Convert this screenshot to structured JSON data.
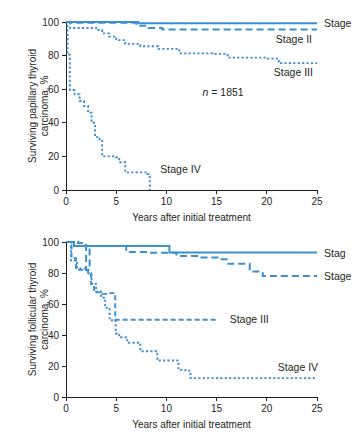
{
  "figure": {
    "title": "",
    "accent_color": "#3b8fd4",
    "text_color": "#231f20"
  },
  "chart_data": [
    {
      "id": "papillary",
      "type": "line",
      "title": "",
      "xlabel": "Years after initial treatment",
      "ylabel": "Surviving papillary thyroid carcinoma, %",
      "xlim": [
        0,
        25
      ],
      "ylim": [
        0,
        100
      ],
      "xticks": [
        0,
        5,
        10,
        15,
        20,
        25
      ],
      "yticks": [
        0,
        20,
        40,
        60,
        80,
        100
      ],
      "grid": false,
      "legend_position": "inline-right",
      "annotation": {
        "symbol": "n",
        "equals": "=",
        "value": "1851",
        "x": 13.6,
        "y": 56
      },
      "series": [
        {
          "name": "Stage I",
          "label": "Stage",
          "label_clipped": true,
          "style": "solid",
          "color": "#3b8fd4",
          "label_x": 25.4,
          "label_y": 99,
          "points": [
            [
              0,
              100
            ],
            [
              7.2,
              100
            ],
            [
              7.2,
              99.3
            ],
            [
              25,
              99.3
            ]
          ]
        },
        {
          "name": "Stage II",
          "label": "Stage II",
          "label_clipped": false,
          "style": "dashed",
          "color": "#3b8fd4",
          "label_x": 20.6,
          "label_y": 90,
          "points": [
            [
              0,
              100
            ],
            [
              0.6,
              100
            ],
            [
              0.6,
              99.6
            ],
            [
              7.0,
              99.6
            ],
            [
              7.0,
              97.8
            ],
            [
              8.2,
              97.8
            ],
            [
              8.2,
              96.5
            ],
            [
              9.6,
              96.5
            ],
            [
              9.6,
              95.6
            ],
            [
              25,
              95.6
            ]
          ]
        },
        {
          "name": "Stage III",
          "label": "Stage III",
          "label_clipped": false,
          "style": "dotted",
          "color": "#3b8fd4",
          "label_x": 20.4,
          "label_y": 70,
          "points": [
            [
              0,
              100
            ],
            [
              0.4,
              100
            ],
            [
              0.4,
              96.4
            ],
            [
              3.0,
              96.4
            ],
            [
              3.0,
              95.2
            ],
            [
              3.6,
              95.2
            ],
            [
              3.6,
              93.2
            ],
            [
              4.3,
              93.2
            ],
            [
              4.3,
              91.3
            ],
            [
              5.0,
              91.3
            ],
            [
              5.0,
              89.2
            ],
            [
              5.9,
              89.2
            ],
            [
              5.9,
              87.0
            ],
            [
              7.4,
              87.0
            ],
            [
              7.4,
              85.6
            ],
            [
              9.2,
              85.6
            ],
            [
              9.2,
              84.0
            ],
            [
              11.3,
              84.0
            ],
            [
              11.3,
              81.3
            ],
            [
              14.6,
              81.3
            ],
            [
              14.6,
              81.0
            ],
            [
              16.1,
              81.0
            ],
            [
              16.1,
              78.8
            ],
            [
              20.0,
              78.8
            ],
            [
              20.0,
              78.2
            ],
            [
              21.2,
              78.2
            ],
            [
              21.2,
              75.5
            ],
            [
              25,
              75.5
            ]
          ]
        },
        {
          "name": "Stage IV",
          "label": "Stage IV",
          "label_clipped": false,
          "style": "dotted",
          "color": "#3b8fd4",
          "label_x": 9.1,
          "label_y": 12.5,
          "points": [
            [
              0,
              100
            ],
            [
              0.15,
              100
            ],
            [
              0.15,
              80.5
            ],
            [
              0.38,
              80.5
            ],
            [
              0.38,
              59.5
            ],
            [
              0.85,
              59.5
            ],
            [
              0.85,
              57.0
            ],
            [
              1.35,
              57.0
            ],
            [
              1.35,
              53.0
            ],
            [
              1.8,
              53.0
            ],
            [
              1.8,
              50.0
            ],
            [
              2.2,
              50.0
            ],
            [
              2.2,
              46.0
            ],
            [
              2.55,
              46.0
            ],
            [
              2.55,
              40.0
            ],
            [
              2.9,
              40.0
            ],
            [
              2.9,
              31.5
            ],
            [
              3.35,
              31.5
            ],
            [
              3.35,
              30.0
            ],
            [
              3.6,
              30.0
            ],
            [
              3.6,
              20.0
            ],
            [
              5.0,
              20.0
            ],
            [
              5.0,
              19.5
            ],
            [
              5.3,
              19.5
            ],
            [
              5.3,
              16.5
            ],
            [
              5.9,
              16.5
            ],
            [
              5.9,
              10.5
            ],
            [
              8.1,
              10.5
            ],
            [
              8.1,
              9.5
            ],
            [
              8.35,
              9.5
            ],
            [
              8.35,
              0
            ]
          ]
        }
      ]
    },
    {
      "id": "follicular",
      "type": "line",
      "title": "",
      "xlabel": "Years after initial treatment",
      "ylabel": "Surviving follicular thyroid carcinoma, %",
      "xlim": [
        0,
        25
      ],
      "ylim": [
        0,
        100
      ],
      "xticks": [
        0,
        5,
        10,
        15,
        20,
        25
      ],
      "yticks": [
        0,
        20,
        40,
        60,
        80,
        100
      ],
      "grid": false,
      "legend_position": "inline-right",
      "annotation": null,
      "series": [
        {
          "name": "Stage I",
          "label": "Stag",
          "label_clipped": true,
          "style": "solid",
          "color": "#3b8fd4",
          "label_x": 25.4,
          "label_y": 93,
          "points": [
            [
              0,
              100
            ],
            [
              0.8,
              100
            ],
            [
              0.8,
              97.5
            ],
            [
              10.3,
              97.5
            ],
            [
              10.3,
              93.2
            ],
            [
              25,
              93.2
            ]
          ]
        },
        {
          "name": "Stage II",
          "label": "Stage",
          "label_clipped": true,
          "style": "dashed",
          "color": "#3b8fd4",
          "label_x": 25.4,
          "label_y": 78,
          "points": [
            [
              0,
              100
            ],
            [
              1.2,
              100
            ],
            [
              1.2,
              99.3
            ],
            [
              2.0,
              99.3
            ],
            [
              2.0,
              82.0
            ],
            [
              2.35,
              82.0
            ],
            [
              2.35,
              97.5
            ],
            [
              6.0,
              97.5
            ],
            [
              6.0,
              93.5
            ],
            [
              8.2,
              93.5
            ],
            [
              8.2,
              93.0
            ],
            [
              11.0,
              93.0
            ],
            [
              11.0,
              91.0
            ],
            [
              13.3,
              91.0
            ],
            [
              13.3,
              90.0
            ],
            [
              15.3,
              90.0
            ],
            [
              15.3,
              88.8
            ],
            [
              16.0,
              88.8
            ],
            [
              16.0,
              86.0
            ],
            [
              18.3,
              86.0
            ],
            [
              18.3,
              81.0
            ],
            [
              19.6,
              81.0
            ],
            [
              19.6,
              78.0
            ],
            [
              25,
              78.0
            ]
          ]
        },
        {
          "name": "Stage III",
          "label": "Stage III",
          "label_clipped": false,
          "style": "dashed-fine",
          "color": "#3b8fd4",
          "label_x": 16.0,
          "label_y": 50,
          "points": [
            [
              0,
              100
            ],
            [
              0.55,
              100
            ],
            [
              0.55,
              89.5
            ],
            [
              1.0,
              89.5
            ],
            [
              1.0,
              82.0
            ],
            [
              2.2,
              82.0
            ],
            [
              2.2,
              80.0
            ],
            [
              2.5,
              80.0
            ],
            [
              2.5,
              73.0
            ],
            [
              2.8,
              73.0
            ],
            [
              2.8,
              67.5
            ],
            [
              3.6,
              67.5
            ],
            [
              3.6,
              66.5
            ],
            [
              4.3,
              66.5
            ],
            [
              4.3,
              67.0
            ],
            [
              4.9,
              67.0
            ],
            [
              4.9,
              49.8
            ],
            [
              15.2,
              49.8
            ]
          ]
        },
        {
          "name": "Stage IV",
          "label": "Stage IV",
          "label_clipped": false,
          "style": "dotted",
          "color": "#3b8fd4",
          "label_x": 20.8,
          "label_y": 19,
          "points": [
            [
              0,
              100
            ],
            [
              0.5,
              100
            ],
            [
              0.5,
              88.0
            ],
            [
              1.1,
              88.0
            ],
            [
              1.1,
              83.0
            ],
            [
              1.9,
              83.0
            ],
            [
              1.9,
              82.0
            ],
            [
              2.25,
              82.0
            ],
            [
              2.25,
              78.5
            ],
            [
              2.55,
              78.5
            ],
            [
              2.55,
              73.0
            ],
            [
              3.0,
              73.0
            ],
            [
              3.0,
              68.0
            ],
            [
              3.5,
              68.0
            ],
            [
              3.5,
              64.0
            ],
            [
              3.9,
              64.0
            ],
            [
              3.9,
              57.5
            ],
            [
              4.35,
              57.5
            ],
            [
              4.35,
              49.5
            ],
            [
              4.95,
              49.5
            ],
            [
              4.95,
              41.0
            ],
            [
              5.3,
              41.0
            ],
            [
              5.3,
              38.5
            ],
            [
              6.1,
              38.5
            ],
            [
              6.1,
              35.0
            ],
            [
              7.4,
              35.0
            ],
            [
              7.4,
              29.5
            ],
            [
              9.1,
              29.5
            ],
            [
              9.1,
              23.5
            ],
            [
              11.2,
              23.5
            ],
            [
              11.2,
              17.5
            ],
            [
              11.9,
              17.5
            ],
            [
              11.9,
              17.0
            ],
            [
              12.4,
              17.0
            ],
            [
              12.4,
              12.2
            ],
            [
              25,
              12.2
            ]
          ]
        }
      ]
    }
  ]
}
